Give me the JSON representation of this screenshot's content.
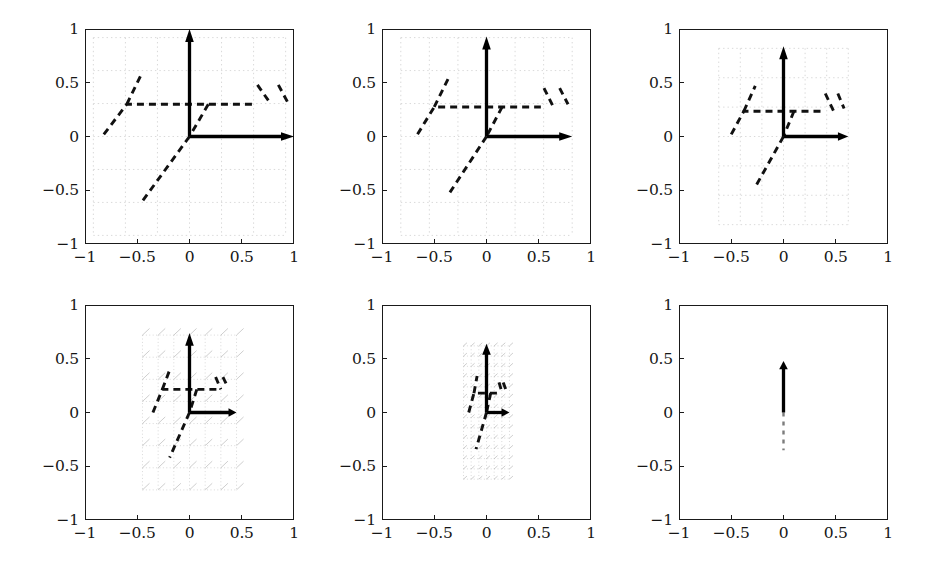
{
  "figure": {
    "type": "multi-panel-vector-field",
    "rows": 2,
    "cols": 3,
    "panel_count": 6,
    "axis": {
      "xticks": [
        -1,
        -0.5,
        0,
        0.5,
        1
      ],
      "xtick_labels": [
        "−1",
        "−0.5",
        "0",
        "0.5",
        "1"
      ],
      "yticks": [
        -1,
        -0.5,
        0,
        0.5,
        1
      ],
      "ytick_labels": [
        "−1",
        "−0.5",
        "0",
        "0.5",
        "1"
      ],
      "xlim": [
        -1,
        1
      ],
      "ylim": [
        -1,
        1
      ],
      "xlabel": "",
      "ylabel": "",
      "grid": "dotted-light-inner-region"
    },
    "colors": {
      "frame": "#1a1a1a",
      "arrow": "#000000",
      "dash": "#111111",
      "grid": "#c9c9c9",
      "background": "#ffffff",
      "tick_text": "#161616"
    }
  },
  "chart_data": {
    "type": "scatter",
    "title": "",
    "xlabel": "",
    "ylabel": "",
    "xlim": [
      -1,
      1
    ],
    "ylim": [
      -1,
      1
    ],
    "grid": true,
    "legend": "none",
    "categories": [
      "panel-1",
      "panel-2",
      "panel-3",
      "panel-4",
      "panel-5",
      "panel-6"
    ],
    "series": [
      {
        "name": "grid_half_width",
        "values": [
          0.92,
          0.82,
          0.62,
          0.45,
          0.22,
          0.0
        ]
      },
      {
        "name": "grid_half_height",
        "values": [
          0.92,
          0.92,
          0.82,
          0.72,
          0.62,
          0.0
        ]
      },
      {
        "name": "vertical_arrow_tip_y",
        "values": [
          1.0,
          0.93,
          0.84,
          0.74,
          0.64,
          0.48
        ]
      },
      {
        "name": "horizontal_arrow_tip_x",
        "values": [
          1.0,
          0.82,
          0.62,
          0.45,
          0.22,
          0.0
        ]
      },
      {
        "name": "plateau_y",
        "values": [
          0.3,
          0.275,
          0.235,
          0.215,
          0.18,
          0.0
        ]
      }
    ],
    "panels": [
      {
        "id": "panel-1",
        "index": 1,
        "grid_region": {
          "x": [
            -0.92,
            0.92
          ],
          "y": [
            -0.92,
            0.92
          ]
        },
        "arrows": [
          {
            "name": "vertical-unit-arrow",
            "from": [
              0,
              0
            ],
            "to": [
              0,
              1.0
            ]
          },
          {
            "name": "horizontal-unit-arrow",
            "from": [
              0,
              0
            ],
            "to": [
              1.0,
              0
            ]
          }
        ],
        "dashed_paths": [
          {
            "name": "ramp-plateau-left",
            "points": [
              [
                -0.82,
                0.02
              ],
              [
                -0.6,
                0.3
              ],
              [
                0.18,
                0.3
              ],
              [
                0.6,
                0.3
              ]
            ]
          },
          {
            "name": "ramp-rise-to-origin",
            "points": [
              [
                0.18,
                0.3
              ],
              [
                0.0,
                0.0
              ]
            ]
          },
          {
            "name": "upper-left-tail",
            "points": [
              [
                -0.6,
                0.3
              ],
              [
                -0.45,
                0.6
              ]
            ]
          },
          {
            "name": "lower-diagonal",
            "points": [
              [
                0.0,
                0.0
              ],
              [
                -0.45,
                -0.6
              ]
            ]
          },
          {
            "name": "right-drop-1",
            "points": [
              [
                0.65,
                0.48
              ],
              [
                0.78,
                0.3
              ]
            ]
          },
          {
            "name": "right-drop-2",
            "points": [
              [
                0.85,
                0.48
              ],
              [
                0.95,
                0.3
              ]
            ]
          }
        ]
      },
      {
        "id": "panel-2",
        "index": 2,
        "grid_region": {
          "x": [
            -0.82,
            0.82
          ],
          "y": [
            -0.92,
            0.92
          ]
        },
        "arrows": [
          {
            "name": "vertical-unit-arrow",
            "from": [
              0,
              0
            ],
            "to": [
              0,
              0.93
            ]
          },
          {
            "name": "horizontal-unit-arrow",
            "from": [
              0,
              0
            ],
            "to": [
              0.82,
              0
            ]
          }
        ],
        "dashed_paths": [
          {
            "name": "ramp-plateau-left",
            "points": [
              [
                -0.66,
                0.02
              ],
              [
                -0.5,
                0.275
              ],
              [
                0.15,
                0.275
              ],
              [
                0.52,
                0.275
              ]
            ]
          },
          {
            "name": "ramp-rise-to-origin",
            "points": [
              [
                0.15,
                0.275
              ],
              [
                0.0,
                0.0
              ]
            ]
          },
          {
            "name": "upper-left-tail",
            "points": [
              [
                -0.5,
                0.275
              ],
              [
                -0.36,
                0.55
              ]
            ]
          },
          {
            "name": "lower-diagonal",
            "points": [
              [
                0.0,
                0.0
              ],
              [
                -0.35,
                -0.52
              ]
            ]
          },
          {
            "name": "right-drop-1",
            "points": [
              [
                0.55,
                0.45
              ],
              [
                0.64,
                0.275
              ]
            ]
          },
          {
            "name": "right-drop-2",
            "points": [
              [
                0.7,
                0.45
              ],
              [
                0.78,
                0.3
              ]
            ]
          }
        ]
      },
      {
        "id": "panel-3",
        "index": 3,
        "grid_region": {
          "x": [
            -0.62,
            0.62
          ],
          "y": [
            -0.82,
            0.82
          ]
        },
        "arrows": [
          {
            "name": "vertical-unit-arrow",
            "from": [
              0,
              0
            ],
            "to": [
              0,
              0.84
            ]
          },
          {
            "name": "horizontal-unit-arrow",
            "from": [
              0,
              0
            ],
            "to": [
              0.62,
              0
            ]
          }
        ],
        "dashed_paths": [
          {
            "name": "ramp-plateau-left",
            "points": [
              [
                -0.5,
                0.02
              ],
              [
                -0.38,
                0.235
              ],
              [
                0.1,
                0.235
              ],
              [
                0.4,
                0.235
              ]
            ]
          },
          {
            "name": "ramp-rise-to-origin",
            "points": [
              [
                0.1,
                0.235
              ],
              [
                0.0,
                0.0
              ]
            ]
          },
          {
            "name": "upper-left-tail",
            "points": [
              [
                -0.38,
                0.235
              ],
              [
                -0.27,
                0.47
              ]
            ]
          },
          {
            "name": "lower-diagonal",
            "points": [
              [
                0.0,
                0.0
              ],
              [
                -0.27,
                -0.47
              ]
            ]
          },
          {
            "name": "right-drop-1",
            "points": [
              [
                0.4,
                0.4
              ],
              [
                0.48,
                0.235
              ]
            ]
          },
          {
            "name": "right-drop-2",
            "points": [
              [
                0.52,
                0.4
              ],
              [
                0.58,
                0.26
              ]
            ]
          }
        ]
      },
      {
        "id": "panel-4",
        "index": 4,
        "grid_region": {
          "x": [
            -0.45,
            0.45
          ],
          "y": [
            -0.72,
            0.72
          ]
        },
        "arrows": [
          {
            "name": "vertical-unit-arrow",
            "from": [
              0,
              0
            ],
            "to": [
              0,
              0.74
            ]
          },
          {
            "name": "horizontal-unit-arrow",
            "from": [
              0,
              0
            ],
            "to": [
              0.45,
              0
            ]
          }
        ],
        "dashed_paths": [
          {
            "name": "ramp-plateau-left",
            "points": [
              [
                -0.35,
                0.0
              ],
              [
                -0.26,
                0.215
              ],
              [
                0.07,
                0.215
              ],
              [
                0.28,
                0.215
              ]
            ]
          },
          {
            "name": "ramp-rise-to-origin",
            "points": [
              [
                0.07,
                0.215
              ],
              [
                0.0,
                0.0
              ]
            ]
          },
          {
            "name": "upper-left-tail",
            "points": [
              [
                -0.26,
                0.215
              ],
              [
                -0.18,
                0.42
              ]
            ]
          },
          {
            "name": "lower-diagonal",
            "points": [
              [
                0.0,
                0.0
              ],
              [
                -0.19,
                -0.42
              ]
            ]
          },
          {
            "name": "right-drop-1",
            "points": [
              [
                0.25,
                0.33
              ],
              [
                0.3,
                0.215
              ]
            ]
          },
          {
            "name": "right-drop-2",
            "points": [
              [
                0.32,
                0.33
              ],
              [
                0.37,
                0.23
              ]
            ]
          }
        ]
      },
      {
        "id": "panel-5",
        "index": 5,
        "grid_region": {
          "x": [
            -0.22,
            0.22
          ],
          "y": [
            -0.62,
            0.62
          ]
        },
        "arrows": [
          {
            "name": "vertical-unit-arrow",
            "from": [
              0,
              0
            ],
            "to": [
              0,
              0.64
            ]
          },
          {
            "name": "horizontal-unit-arrow",
            "from": [
              0,
              0
            ],
            "to": [
              0.22,
              0
            ]
          }
        ],
        "dashed_paths": [
          {
            "name": "ramp-plateau-left",
            "points": [
              [
                -0.17,
                0.0
              ],
              [
                -0.12,
                0.18
              ],
              [
                0.04,
                0.18
              ],
              [
                0.14,
                0.18
              ]
            ]
          },
          {
            "name": "ramp-rise-to-origin",
            "points": [
              [
                0.04,
                0.18
              ],
              [
                0.0,
                0.0
              ]
            ]
          },
          {
            "name": "upper-left-tail",
            "points": [
              [
                -0.12,
                0.18
              ],
              [
                -0.09,
                0.34
              ]
            ]
          },
          {
            "name": "lower-diagonal",
            "points": [
              [
                0.0,
                0.0
              ],
              [
                -0.1,
                -0.34
              ]
            ]
          },
          {
            "name": "right-drop-1",
            "points": [
              [
                0.12,
                0.28
              ],
              [
                0.15,
                0.18
              ]
            ]
          },
          {
            "name": "right-drop-2",
            "points": [
              [
                0.16,
                0.28
              ],
              [
                0.19,
                0.2
              ]
            ]
          }
        ]
      },
      {
        "id": "panel-6",
        "index": 6,
        "grid_region": null,
        "arrows": [
          {
            "name": "vertical-unit-arrow",
            "from": [
              0,
              0
            ],
            "to": [
              0,
              0.48
            ]
          }
        ],
        "dashed_paths": [
          {
            "name": "fading-vertical-tail",
            "points": [
              [
                0.0,
                0.0
              ],
              [
                0.0,
                -0.35
              ]
            ]
          }
        ]
      }
    ]
  }
}
